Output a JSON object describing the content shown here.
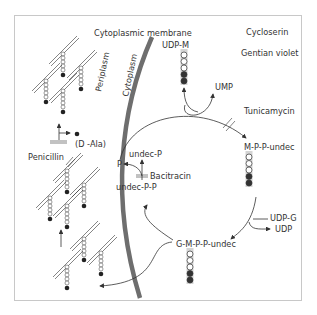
{
  "labels": {
    "membrane": "Cytoplasmic membrane",
    "periplasm": "Periplasm",
    "cytoplasm": "Cytoplasm"
  },
  "antibiotics": {
    "cycloserin": "Cycloserin",
    "gentian_violet": "Gentian violet",
    "tunicamycin": "Tunicamycin",
    "bacitracin": "Bacitracin",
    "penicillin": "Penicillin"
  },
  "molecules": {
    "udp_m_prefix": "UDP-",
    "udp_m_suffix": "M",
    "ump": "UMP",
    "m_pp_undec_m": "M",
    "m_pp_undec_rest": "-P-P-undec",
    "undec_p": "undec-P",
    "p": "P",
    "undec_pp": "undec-P-P",
    "udp_g": "UDP-G",
    "udp": "UDP",
    "gm_g": "G-",
    "gm_m": "M",
    "gm_rest": "-P-P-undec",
    "d_ala": "(D -Ala)",
    "chain_m": "M"
  },
  "colors": {
    "membrane": "#6e6e6e",
    "line": "#333333",
    "text": "#333333",
    "highlight": "#d4d4d4",
    "frame": "#c8c8c8"
  }
}
